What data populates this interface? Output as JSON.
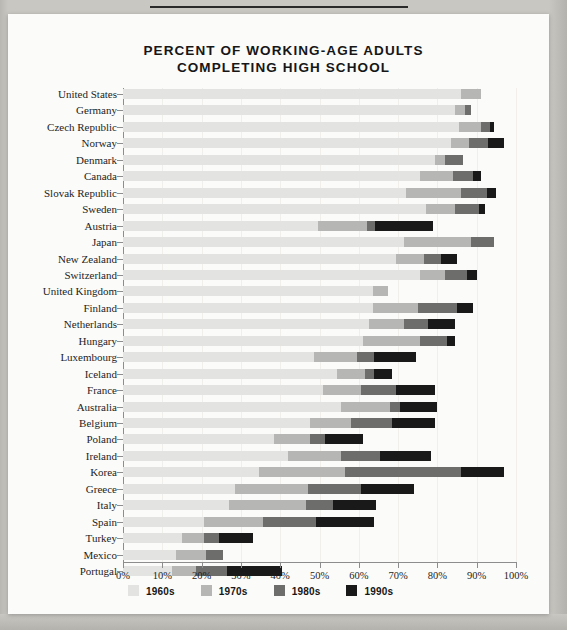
{
  "page": {
    "title_line1": "PERCENT OF WORKING-AGE ADULTS",
    "title_line2": "COMPLETING HIGH SCHOOL"
  },
  "legend": {
    "items": [
      {
        "label": "1960s",
        "color": "#e3e3e1"
      },
      {
        "label": "1970s",
        "color": "#b6b6b4"
      },
      {
        "label": "1980s",
        "color": "#6d6d6b"
      },
      {
        "label": "1990s",
        "color": "#191919"
      }
    ]
  },
  "axis": {
    "x_ticks": [
      "0%",
      "10%",
      "20%",
      "30%",
      "40%",
      "50%",
      "60%",
      "70%",
      "80%",
      "90%",
      "100%"
    ],
    "x_min": 0,
    "x_max": 100
  },
  "chart_data": {
    "type": "bar",
    "orientation": "horizontal",
    "stacked": true,
    "title": "PERCENT OF WORKING-AGE ADULTS COMPLETING HIGH SCHOOL",
    "xlabel": "",
    "ylabel": "",
    "xlim": [
      0,
      100
    ],
    "grid": false,
    "legend_position": "bottom",
    "series": [
      {
        "name": "1960s",
        "color": "#e3e3e1"
      },
      {
        "name": "1970s",
        "color": "#b6b6b4"
      },
      {
        "name": "1980s",
        "color": "#6d6d6b"
      },
      {
        "name": "1990s",
        "color": "#191919"
      }
    ],
    "categories": [
      "United States",
      "Germany",
      "Czech Republic",
      "Norway",
      "Denmark",
      "Canada",
      "Slovak Republic",
      "Sweden",
      "Austria",
      "Japan",
      "New Zealand",
      "Switzerland",
      "United Kingdom",
      "Finland",
      "Netherlands",
      "Hungary",
      "Luxembourg",
      "Iceland",
      "France",
      "Australia",
      "Belgium",
      "Poland",
      "Ireland",
      "Korea",
      "Greece",
      "Italy",
      "Spain",
      "Turkey",
      "Mexico",
      "Portugal"
    ],
    "rows": [
      {
        "country": "United States",
        "s1960": 86.0,
        "s1970": 5.0,
        "s1980": 0.0,
        "s1990": 0.0,
        "total": 91.0
      },
      {
        "country": "Germany",
        "s1960": 84.5,
        "s1970": 2.5,
        "s1980": 1.5,
        "s1990": 0.0,
        "total": 88.5
      },
      {
        "country": "Czech Republic",
        "s1960": 85.5,
        "s1970": 5.5,
        "s1980": 2.5,
        "s1990": 1.0,
        "total": 94.5
      },
      {
        "country": "Norway",
        "s1960": 83.5,
        "s1970": 4.5,
        "s1980": 5.0,
        "s1990": 4.0,
        "total": 97.0
      },
      {
        "country": "Denmark",
        "s1960": 79.5,
        "s1970": 2.5,
        "s1980": 4.5,
        "s1990": 0.0,
        "total": 86.5
      },
      {
        "country": "Canada",
        "s1960": 75.5,
        "s1970": 8.5,
        "s1980": 5.0,
        "s1990": 2.0,
        "total": 91.0
      },
      {
        "country": "Slovak Republic",
        "s1960": 72.0,
        "s1970": 14.0,
        "s1980": 6.5,
        "s1990": 2.5,
        "total": 95.0
      },
      {
        "country": "Sweden",
        "s1960": 77.0,
        "s1970": 7.5,
        "s1980": 6.0,
        "s1990": 1.5,
        "total": 92.0
      },
      {
        "country": "Austria",
        "s1960": 49.5,
        "s1970": 12.5,
        "s1980": 2.0,
        "s1990": 15.0,
        "total": 79.0
      },
      {
        "country": "Japan",
        "s1960": 71.5,
        "s1970": 17.0,
        "s1980": 6.0,
        "s1990": 0.0,
        "total": 94.5
      },
      {
        "country": "New Zealand",
        "s1960": 69.5,
        "s1970": 7.0,
        "s1980": 4.5,
        "s1990": 4.0,
        "total": 85.0
      },
      {
        "country": "Switzerland",
        "s1960": 75.5,
        "s1970": 6.5,
        "s1980": 5.5,
        "s1990": 2.5,
        "total": 90.0
      },
      {
        "country": "United Kingdom",
        "s1960": 63.5,
        "s1970": 4.0,
        "s1980": 0.0,
        "s1990": 0.0,
        "total": 67.5
      },
      {
        "country": "Finland",
        "s1960": 63.5,
        "s1970": 11.5,
        "s1980": 10.0,
        "s1990": 4.0,
        "total": 89.0
      },
      {
        "country": "Netherlands",
        "s1960": 62.5,
        "s1970": 9.0,
        "s1980": 6.0,
        "s1990": 7.0,
        "total": 84.5
      },
      {
        "country": "Hungary",
        "s1960": 61.0,
        "s1970": 14.5,
        "s1980": 7.0,
        "s1990": 2.0,
        "total": 84.5
      },
      {
        "country": "Luxembourg",
        "s1960": 48.5,
        "s1970": 11.0,
        "s1980": 4.5,
        "s1990": 10.5,
        "total": 74.5
      },
      {
        "country": "Iceland",
        "s1960": 54.5,
        "s1970": 7.0,
        "s1980": 2.5,
        "s1990": 4.5,
        "total": 68.5
      },
      {
        "country": "France",
        "s1960": 51.0,
        "s1970": 9.5,
        "s1980": 9.0,
        "s1990": 10.0,
        "total": 79.5
      },
      {
        "country": "Australia",
        "s1960": 55.5,
        "s1970": 12.5,
        "s1980": 2.5,
        "s1990": 9.5,
        "total": 80.0
      },
      {
        "country": "Belgium",
        "s1960": 47.5,
        "s1970": 10.5,
        "s1980": 10.5,
        "s1990": 11.0,
        "total": 79.5
      },
      {
        "country": "Poland",
        "s1960": 38.5,
        "s1970": 9.0,
        "s1980": 4.0,
        "s1990": 9.5,
        "total": 61.0
      },
      {
        "country": "Ireland",
        "s1960": 42.0,
        "s1970": 13.5,
        "s1980": 10.0,
        "s1990": 13.0,
        "total": 78.5
      },
      {
        "country": "Korea",
        "s1960": 34.5,
        "s1970": 22.0,
        "s1980": 29.5,
        "s1990": 11.0,
        "total": 97.0
      },
      {
        "country": "Greece",
        "s1960": 28.5,
        "s1970": 18.5,
        "s1980": 13.5,
        "s1990": 13.5,
        "total": 74.0
      },
      {
        "country": "Italy",
        "s1960": 27.0,
        "s1970": 19.5,
        "s1980": 7.0,
        "s1990": 11.0,
        "total": 64.5
      },
      {
        "country": "Spain",
        "s1960": 20.5,
        "s1970": 15.0,
        "s1980": 13.5,
        "s1990": 15.0,
        "total": 64.0
      },
      {
        "country": "Turkey",
        "s1960": 15.0,
        "s1970": 5.5,
        "s1980": 4.0,
        "s1990": 8.5,
        "total": 33.0
      },
      {
        "country": "Mexico",
        "s1960": 13.5,
        "s1970": 7.5,
        "s1980": 4.5,
        "s1990": 0.0,
        "total": 25.5
      },
      {
        "country": "Portugal",
        "s1960": 12.5,
        "s1970": 6.0,
        "s1980": 8.0,
        "s1990": 14.0,
        "total": 40.5
      }
    ]
  }
}
